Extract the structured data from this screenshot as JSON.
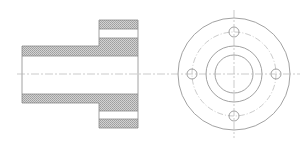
{
  "drawing": {
    "title": "Flanged bushing - section and end view",
    "colors": {
      "background": "#ffffff",
      "outline": "#8a8a8a",
      "hatch_light": "#d4d4d4",
      "hatch_dark": "#9c9c9c",
      "centerline": "#b5b5b5"
    },
    "section_view": {
      "shaft": {
        "x": 22,
        "y_top": 46,
        "y_bottom": 103,
        "x_end": 138,
        "wall": 10
      },
      "flange": {
        "x": 99,
        "x_end": 138,
        "y_top": 20,
        "y_bottom": 128
      },
      "bolt_hole_slots": [
        {
          "y_top": 29,
          "y_bottom": 38
        },
        {
          "y_top": 111,
          "y_bottom": 119
        }
      ],
      "bore": {
        "y_top": 56,
        "y_bottom": 94
      }
    },
    "end_view": {
      "center": {
        "x": 234,
        "y": 74
      },
      "outer_radius": 56,
      "bolt_circle_radius": 42,
      "hub_radius": 28,
      "bore_radius": 19,
      "bolt_hole_radius": 5,
      "bolt_hole_count": 4
    },
    "centerline": {
      "y": 74,
      "x_start": 17,
      "x_end": 300,
      "v_y_start": 10,
      "v_y_end": 138
    }
  }
}
